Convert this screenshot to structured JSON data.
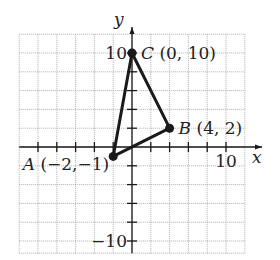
{
  "chart_data": {
    "type": "scatter",
    "title": "",
    "xlabel": "x",
    "ylabel": "y",
    "xlim": [
      -12,
      12
    ],
    "ylim": [
      -11.3,
      12
    ],
    "grid": true,
    "grid_step": 2,
    "axis_tick_step": 2,
    "tick_labels": {
      "x": [
        {
          "value": 10,
          "label": "10"
        }
      ],
      "y": [
        {
          "value": 10,
          "label": "10"
        },
        {
          "value": -10,
          "label": "−10"
        }
      ]
    },
    "points": [
      {
        "name": "A",
        "x": -2,
        "y": -1,
        "label": "A",
        "coord_text": "(−2,−1)"
      },
      {
        "name": "B",
        "x": 4,
        "y": 2,
        "label": "B",
        "coord_text": "(4, 2)"
      },
      {
        "name": "C",
        "x": 0,
        "y": 10,
        "label": "C",
        "coord_text": "(0, 10)"
      }
    ],
    "polygon": [
      "A",
      "B",
      "C"
    ],
    "legend": null
  },
  "colors": {
    "grid": "#9a9a9a",
    "axis": "#1a1a1a",
    "triangle": "#1a1a1a",
    "text": "#222222"
  }
}
